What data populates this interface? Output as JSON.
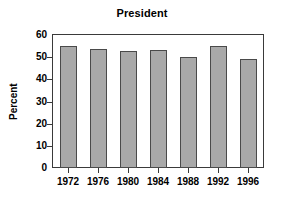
{
  "chart_data": {
    "type": "bar",
    "title": "President",
    "xlabel": "",
    "ylabel": "Percent",
    "categories": [
      "1972",
      "1976",
      "1980",
      "1984",
      "1988",
      "1992",
      "1996"
    ],
    "values": [
      55,
      53.5,
      52.8,
      53.2,
      50.2,
      55,
      49
    ],
    "ylim": [
      0,
      60
    ],
    "yticks": [
      0,
      10,
      20,
      30,
      40,
      50,
      60
    ],
    "ytick_labels": [
      "0",
      "10",
      "20",
      "30",
      "40",
      "50",
      "60"
    ],
    "grid": false,
    "legend": null,
    "series": [
      {
        "name": "Percent",
        "values": [
          55,
          53.5,
          52.8,
          53.2,
          50.2,
          55,
          49
        ]
      }
    ],
    "colors": {
      "bar_fill": "#a9a9a9",
      "bar_border": "#4a4a4a",
      "axis": "#3a3a3a",
      "text": "#000000",
      "background": "#ffffff"
    }
  }
}
